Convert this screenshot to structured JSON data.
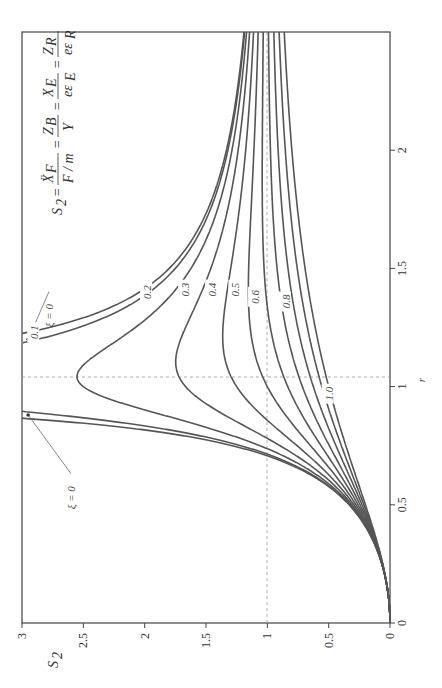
{
  "chart_data": {
    "type": "line",
    "orientation": "rotated-90-ccw",
    "title": "",
    "xlabel": "r",
    "ylabel": "S2",
    "xlim": [
      0,
      2.5
    ],
    "ylim": [
      0,
      3
    ],
    "x_ticks": [
      "0",
      "0.5",
      "1",
      "1.5",
      "2"
    ],
    "y_ticks": [
      "0",
      "0.5",
      "1",
      "1.5",
      "2",
      "2.5",
      "3"
    ],
    "equation": "S2 = Ẍ_F/(F/m) = Z_B/Y = X_E/(ε ε_E) = Z_R/(ε ε_R)",
    "formula": "S2 = r^2 / sqrt((1 - r^2)^2 + (2 xi r)^2)",
    "grid": false,
    "reference_lines": [
      {
        "axis": "x",
        "value": 1,
        "style": "dashed"
      },
      {
        "axis": "y",
        "value": 1,
        "style": "dashed"
      }
    ],
    "series": [
      {
        "name": "ξ = 0",
        "xi": 0
      },
      {
        "name": "0.1",
        "xi": 0.1
      },
      {
        "name": "0.2",
        "xi": 0.2
      },
      {
        "name": "0.3",
        "xi": 0.3
      },
      {
        "name": "0.4",
        "xi": 0.4
      },
      {
        "name": "0.5",
        "xi": 0.5
      },
      {
        "name": "0.6",
        "xi": 0.6
      },
      {
        "name": "0.7",
        "xi": 0.7
      },
      {
        "name": "0.8",
        "xi": 0.8
      },
      {
        "name": "0.9",
        "xi": 0.9
      },
      {
        "name": "1.0",
        "xi": 1.0
      }
    ],
    "sample_values": {
      "r": [
        0,
        0.25,
        0.5,
        0.75,
        1.0,
        1.25,
        1.5,
        2.0,
        2.5
      ],
      "xi_0.2": [
        0,
        0.066,
        0.32,
        1.05,
        2.5,
        2.33,
        1.69,
        1.29,
        1.18
      ],
      "xi_1.0": [
        0,
        0.059,
        0.2,
        0.36,
        0.5,
        0.61,
        0.69,
        0.8,
        0.86
      ]
    },
    "curve_labels": [
      {
        "text": "ξ = 0",
        "r": 1.3,
        "s2": 2.78,
        "arrow_to_r": 1.2
      },
      {
        "text": "ξ = 0",
        "r": 0.53,
        "s2": 2.6,
        "arrow_to_r": 0.88
      },
      {
        "text": "0.1",
        "r": 1.23,
        "s2": 2.9
      },
      {
        "text": "0.2",
        "r": 1.4,
        "s2": 1.98
      },
      {
        "text": "0.3",
        "r": 1.41,
        "s2": 1.67
      },
      {
        "text": "0.4",
        "r": 1.41,
        "s2": 1.45
      },
      {
        "text": "0.5",
        "r": 1.41,
        "s2": 1.26
      },
      {
        "text": "0.6",
        "r": 1.38,
        "s2": 1.1
      },
      {
        "text": "0.8",
        "r": 1.36,
        "s2": 0.85
      },
      {
        "text": "1.0",
        "r": 0.97,
        "s2": 0.5
      }
    ]
  },
  "labels": {
    "xlabel": "r",
    "ylabel_main": "S",
    "ylabel_sub": "2",
    "ticks_r": [
      "0",
      "0.5",
      "1",
      "1.5",
      "2"
    ],
    "ticks_s": [
      "0",
      "0.5",
      "1",
      "1.5",
      "2",
      "2.5",
      "3"
    ],
    "xi0_label": "ξ = 0",
    "eq_lhs": "S",
    "eq_lhs_sub": "2",
    "eq_f1_num": "Ẍ",
    "eq_f1_num_sub": "F",
    "eq_f1_den": "F / m",
    "eq_f2_num": "Z",
    "eq_f2_num_sub": "B",
    "eq_f2_den": "Y",
    "eq_f3_num": "X",
    "eq_f3_num_sub": "E",
    "eq_f3_den": "eε",
    "eq_f3_den_sub": "E",
    "eq_f4_num": "Z",
    "eq_f4_num_sub": "R",
    "eq_f4_den": "eε",
    "eq_f4_den_sub": "R",
    "eq_sign": "="
  },
  "colors": {
    "curve": "#555555",
    "axis": "#444444",
    "dashed": "#999999",
    "text": "#333333"
  }
}
